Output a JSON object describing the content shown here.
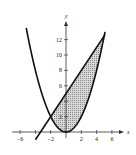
{
  "chart_data": {
    "type": "line",
    "title": "",
    "xlabel": "x",
    "ylabel": "y",
    "xlim": [
      -7,
      7.5
    ],
    "ylim": [
      -1.5,
      14
    ],
    "x_ticks": [
      -6,
      -4,
      -2,
      2,
      4,
      6
    ],
    "x_tick_labels": [
      "-6",
      "",
      "-2",
      "2",
      "4",
      "6"
    ],
    "y_ticks": [
      2,
      4,
      6,
      8,
      10,
      12
    ],
    "y_tick_labels": [
      "2",
      "",
      "6",
      "8",
      "10",
      "12"
    ],
    "grid": false,
    "series": [
      {
        "name": "parabola",
        "equation": "y = x^2/2",
        "x_range": [
          -5.2,
          5.1
        ]
      },
      {
        "name": "line",
        "equation": "y = 3x/2 + 5",
        "x_range": [
          -4,
          5.1
        ]
      }
    ],
    "intersections": [
      [
        -2,
        2
      ],
      [
        5,
        12.5
      ]
    ],
    "shaded_region": {
      "between": [
        "line",
        "parabola"
      ],
      "x_range": [
        -2,
        5
      ]
    },
    "colors": {
      "curve": "#111111",
      "shade": "#bdbdbd",
      "axis": "#333333"
    }
  }
}
